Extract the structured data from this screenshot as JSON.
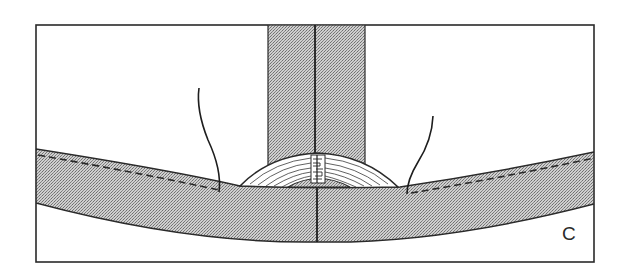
{
  "figure": {
    "panel_label": "C",
    "colors": {
      "stroke": "#2a2a2a",
      "hatch_dark": "#7a7a7a",
      "hatch_light": "#d6d6d6",
      "background": "#ffffff"
    },
    "components": [
      {
        "name": "frame",
        "label": ""
      },
      {
        "name": "vertical-post",
        "label": ""
      },
      {
        "name": "curved-band",
        "label": ""
      },
      {
        "name": "laminated-arch",
        "label": ""
      },
      {
        "name": "joint-block",
        "label": ""
      },
      {
        "name": "left-thread",
        "label": ""
      },
      {
        "name": "right-thread",
        "label": ""
      },
      {
        "name": "dashed-stitch-line-left",
        "label": ""
      },
      {
        "name": "dashed-stitch-line-right",
        "label": ""
      }
    ]
  }
}
